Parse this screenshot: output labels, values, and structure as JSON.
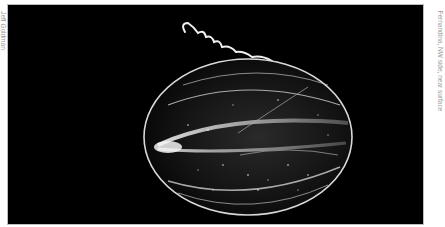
{
  "photo": {
    "subject": "comb jelly (ctenophore) on black background",
    "background_color": "#000000",
    "subject_color": "#e6e6e6"
  },
  "captions": {
    "credit": "Jeff Goldman",
    "location": "Fernandina, NW side, near surface"
  }
}
